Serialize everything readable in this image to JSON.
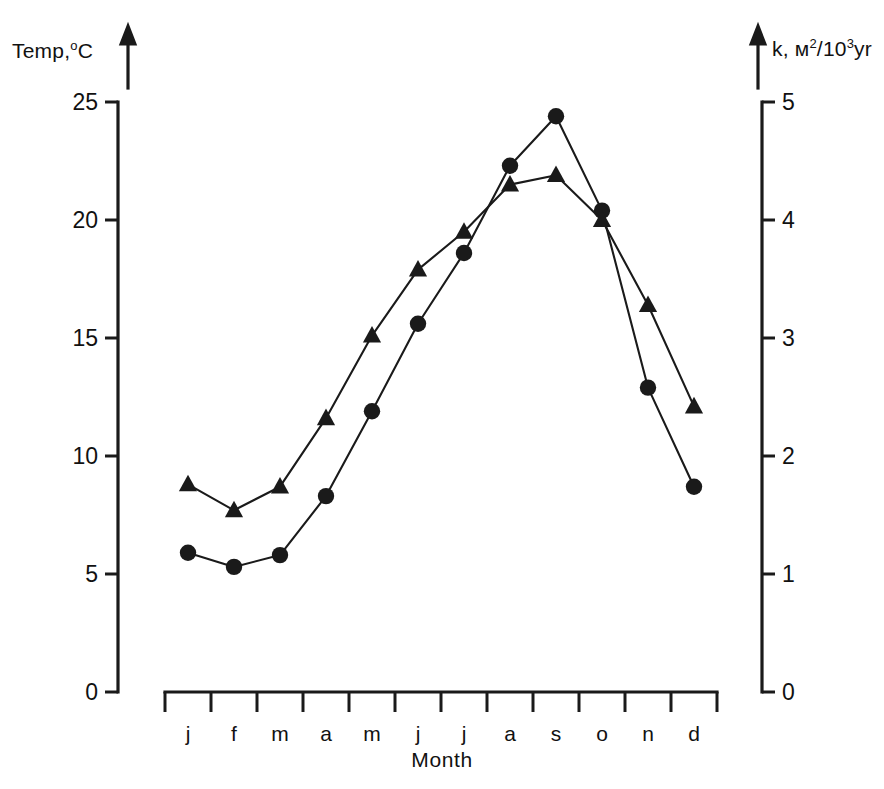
{
  "chart_data": {
    "type": "line",
    "title": "",
    "xlabel": "Month",
    "categories": [
      "j",
      "f",
      "m",
      "a",
      "m",
      "j",
      "j",
      "a",
      "s",
      "o",
      "n",
      "d"
    ],
    "left_axis": {
      "label": "Temp, °C",
      "label_text": "Temp,",
      "label_unit_sup": "o",
      "label_unit": "C",
      "ticks": [
        0,
        5,
        10,
        15,
        20,
        25
      ],
      "tick_labels": [
        "0",
        "5",
        "10",
        "15",
        "20",
        "25"
      ],
      "ylim": [
        0,
        25
      ],
      "has_arrow": true
    },
    "right_axis": {
      "label": "k, м²/10³yr",
      "label_prefix": "k, м",
      "label_sup1": "2",
      "label_mid": "/10",
      "label_sup2": "3",
      "label_suffix": "yr",
      "ticks": [
        0,
        1,
        2,
        3,
        4,
        5
      ],
      "tick_labels": [
        "0",
        "1",
        "2",
        "3",
        "4",
        "5"
      ],
      "ylim": [
        0,
        5
      ],
      "has_arrow": true
    },
    "grid": false,
    "legend": "none",
    "series": [
      {
        "name": "temperature",
        "marker": "circle",
        "axis": "left",
        "values": [
          5.9,
          5.3,
          5.8,
          8.3,
          11.9,
          15.6,
          18.6,
          22.3,
          24.4,
          20.4,
          12.9,
          8.7
        ]
      },
      {
        "name": "k",
        "marker": "triangle",
        "axis": "right",
        "values_left_scale": [
          8.8,
          7.7,
          8.7,
          11.6,
          15.1,
          17.9,
          19.5,
          21.5,
          21.9,
          20.0,
          16.4,
          12.1
        ],
        "values": [
          1.76,
          1.54,
          1.74,
          2.32,
          3.02,
          3.58,
          3.9,
          4.3,
          4.38,
          4.0,
          3.28,
          2.42
        ]
      }
    ]
  },
  "colors": {
    "ink": "#1a1a1a",
    "background": "#ffffff"
  }
}
